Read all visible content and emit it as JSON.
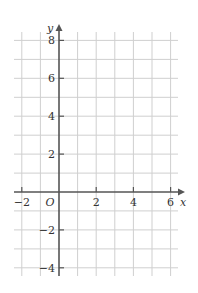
{
  "graph": {
    "type": "coordinate-grid",
    "x_axis": {
      "label": "x",
      "range": [
        -2.5,
        6.5
      ],
      "tick_labels": [
        "−2",
        "2",
        "4",
        "6"
      ],
      "tick_values": [
        -2,
        2,
        4,
        6
      ]
    },
    "y_axis": {
      "label": "y",
      "range": [
        -4.5,
        8.5
      ],
      "tick_labels": [
        "8",
        "6",
        "4",
        "2",
        "−2",
        "−4"
      ],
      "tick_values": [
        8,
        6,
        4,
        2,
        -2,
        -4
      ]
    },
    "origin_label": "O",
    "grid_step": 1,
    "colors": {
      "grid": "#cfcfcf",
      "axis": "#555555",
      "text": "#333333"
    }
  }
}
